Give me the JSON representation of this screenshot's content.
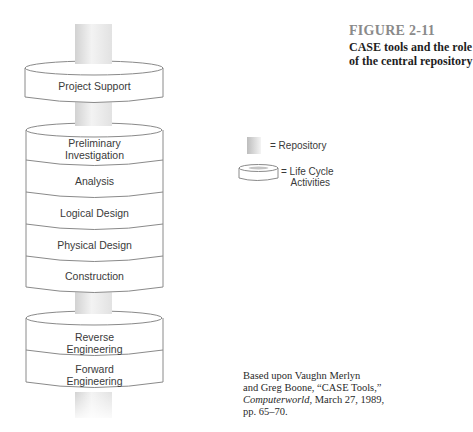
{
  "figure": {
    "number": "FIGURE 2-11",
    "title": "CASE tools and the role of the central repository"
  },
  "diagram": {
    "top_cylinder": {
      "label": "Project Support"
    },
    "middle_cylinder": {
      "layers": [
        {
          "line1": "Preliminary",
          "line2": "Investigation"
        },
        {
          "line1": "Analysis"
        },
        {
          "line1": "Logical Design"
        },
        {
          "line1": "Physical Design"
        },
        {
          "line1": "Construction"
        }
      ]
    },
    "bottom_cylinder": {
      "layers": [
        {
          "line1": "Reverse",
          "line2": "Engineering"
        },
        {
          "line1": "Forward",
          "line2": "Engineering"
        }
      ]
    }
  },
  "legend": {
    "repository": "= Repository",
    "lifecycle_line1": "= Life Cycle",
    "lifecycle_line2": "Activities"
  },
  "source": {
    "line1": "Based upon Vaughn Merlyn",
    "line2": "and Greg Boone, “CASE Tools,”",
    "line3_italic": "Computerworld",
    "line3_rest": ", March 27, 1989,",
    "line4": "pp. 65–70."
  },
  "colors": {
    "outline": "#8a8a8a",
    "text": "#3a3a3a",
    "figure_number": "#8a8a8a",
    "repository_dark": "#c4c4c4",
    "repository_light": "#f6f6f6"
  }
}
